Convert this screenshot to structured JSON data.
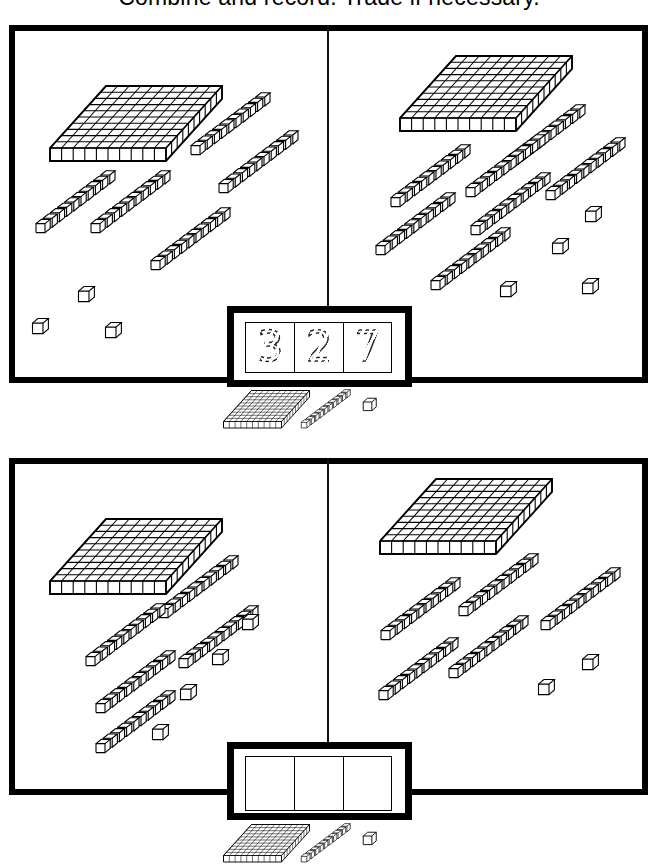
{
  "worksheet": {
    "title": "Combine and record. Trade if necessary.",
    "block_legend": {
      "flat_label": "hundreds-flat",
      "rod_label": "tens-rod",
      "cube_label": "ones-cube"
    }
  },
  "problems": [
    {
      "id": "problem-1",
      "left_panel": {
        "flats": 1,
        "rods": 5,
        "cubes": 3,
        "value": 153
      },
      "right_panel": {
        "flats": 1,
        "rods": 7,
        "cubes": 4,
        "value": 174
      },
      "answer": {
        "filled": true,
        "style": "traced-dashed",
        "digits": [
          "3",
          "2",
          "7"
        ],
        "value": "327"
      }
    },
    {
      "id": "problem-2",
      "left_panel": {
        "flats": 1,
        "rods": 5,
        "cubes": 4,
        "value": 154
      },
      "right_panel": {
        "flats": 1,
        "rods": 5,
        "cubes": 2,
        "value": 152
      },
      "answer": {
        "filled": false,
        "style": "blank",
        "digits": [
          "",
          "",
          ""
        ],
        "value": ""
      }
    }
  ],
  "colors": {
    "ink": "#000000",
    "paper": "#ffffff",
    "frame": "#000000"
  }
}
